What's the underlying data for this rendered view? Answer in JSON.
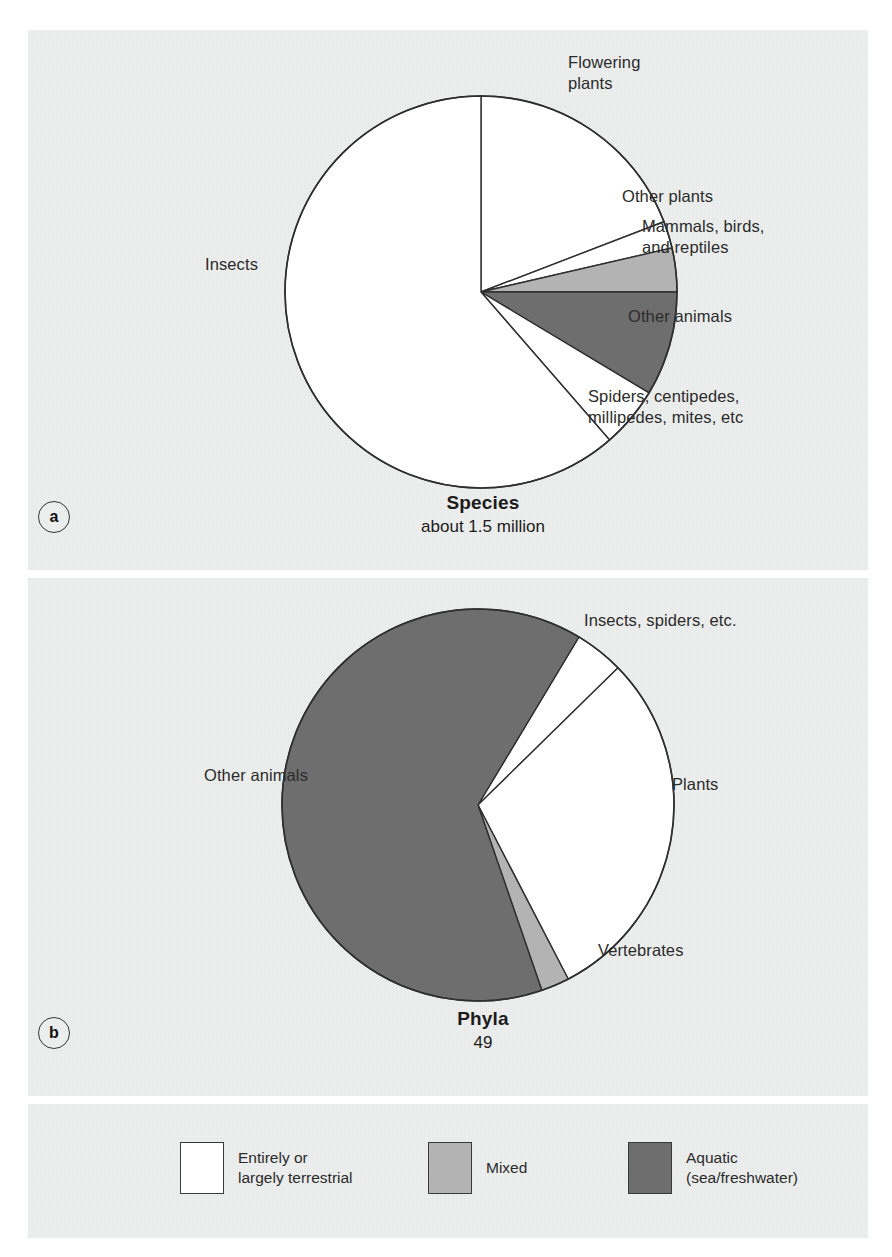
{
  "figure": {
    "background_color": "#ffffff",
    "panel_color": "#eceded"
  },
  "colors": {
    "terrestrial": "#ffffff",
    "mixed": "#b3b3b3",
    "aquatic": "#6e6e6e",
    "outline": "#2f2f2f",
    "text": "#2b2b2b"
  },
  "panel_a": {
    "key": "a",
    "caption_title": "Species",
    "caption_sub": "about 1.5 million",
    "labels": {
      "insects": "Insects",
      "flowering_plants": "Flowering\nplants",
      "other_plants": "Other plants",
      "mammals_birds_reptiles": "Mammals, birds,\nand reptiles",
      "other_animals": "Other animals",
      "spiders": "Spiders, centipedes,\nmillipedes, mites, etc"
    }
  },
  "panel_b": {
    "key": "b",
    "caption_title": "Phyla",
    "caption_sub": "49",
    "labels": {
      "other_animals": "Other animals",
      "insects_spiders": "Insects, spiders, etc.",
      "plants": "Plants",
      "vertebrates": "Vertebrates"
    }
  },
  "legend": {
    "items": [
      {
        "label": "Entirely or\nlargely terrestrial",
        "color": "#ffffff",
        "swatch_name": "terrestrial-swatch"
      },
      {
        "label": "Mixed",
        "color": "#b3b3b3",
        "swatch_name": "mixed-swatch"
      },
      {
        "label": "Aquatic\n(sea/freshwater)",
        "color": "#6e6e6e",
        "swatch_name": "aquatic-swatch"
      }
    ]
  },
  "chart_data": [
    {
      "id": "species-pie",
      "type": "pie",
      "title": "Species",
      "subtitle": "about 1.5 million",
      "total_label": "about 1.5 million",
      "start_angle_deg": -90,
      "direction": "clockwise",
      "center": [
        453,
        262
      ],
      "radius": 196,
      "legend_position": "bottom-shared",
      "slices": [
        {
          "label": "Flowering plants",
          "percent": 19.2,
          "angle_deg": 69,
          "habitat": "Entirely or largely terrestrial",
          "color": "#ffffff"
        },
        {
          "label": "Other plants",
          "percent": 2.2,
          "angle_deg": 8,
          "habitat": "Entirely or largely terrestrial",
          "color": "#ffffff"
        },
        {
          "label": "Mammals, birds, and reptiles",
          "percent": 3.6,
          "angle_deg": 13,
          "habitat": "Mixed",
          "color": "#b3b3b3"
        },
        {
          "label": "Other animals",
          "percent": 8.6,
          "angle_deg": 31,
          "habitat": "Aquatic (sea/freshwater)",
          "color": "#6e6e6e"
        },
        {
          "label": "Spiders, centipedes, millipedes, mites, etc",
          "percent": 5.0,
          "angle_deg": 18,
          "habitat": "Entirely or largely terrestrial",
          "color": "#ffffff"
        },
        {
          "label": "Insects",
          "percent": 61.4,
          "angle_deg": 221,
          "habitat": "Entirely or largely terrestrial",
          "color": "#ffffff"
        }
      ]
    },
    {
      "id": "phyla-pie",
      "type": "pie",
      "title": "Phyla",
      "subtitle": "49",
      "total_label": "49",
      "total_value": 49,
      "start_angle_deg": -59,
      "direction": "clockwise",
      "center": [
        450,
        227
      ],
      "radius": 196,
      "legend_position": "bottom-shared",
      "slices": [
        {
          "label": "Insects, spiders, etc.",
          "percent": 4.1,
          "angle_deg": 14.6,
          "habitat": "Entirely or largely terrestrial",
          "color": "#ffffff"
        },
        {
          "label": "Plants",
          "percent": 29.8,
          "angle_deg": 107,
          "habitat": "Entirely or largely terrestrial",
          "color": "#ffffff"
        },
        {
          "label": "Vertebrates",
          "percent": 2.3,
          "angle_deg": 8.4,
          "habitat": "Mixed",
          "color": "#b3b3b3"
        },
        {
          "label": "Other animals",
          "percent": 63.8,
          "angle_deg": 230,
          "habitat": "Aquatic (sea/freshwater)",
          "color": "#6e6e6e"
        }
      ]
    }
  ]
}
